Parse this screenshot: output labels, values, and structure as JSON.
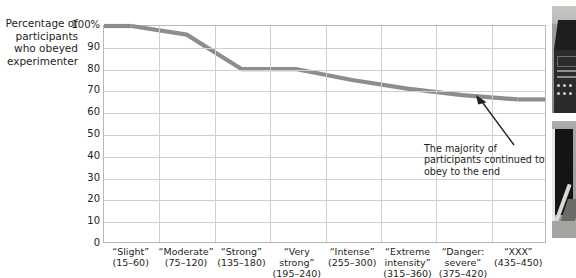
{
  "figure": {
    "y_axis_title": "Percentage of participants who obeyed experimenter",
    "annotation": "The majority of participants continued to obey to the end",
    "line_color": "#8d8d8d",
    "grid_color": "#cfcfcf",
    "text_color": "#231f20",
    "photo_fragments": [
      {
        "name": "shock-generator-photo",
        "alt": "photo-fragment-top"
      },
      {
        "name": "experiment-room-photo",
        "alt": "photo-fragment-bottom"
      }
    ]
  },
  "chart_data": {
    "type": "line",
    "title": "",
    "xlabel": "",
    "ylabel": "Percentage of participants who obeyed experimenter",
    "ylim": [
      0,
      100
    ],
    "yticks": [
      100,
      90,
      80,
      70,
      60,
      50,
      40,
      30,
      20,
      10,
      0
    ],
    "ytick_labels": [
      "100%",
      "90",
      "80",
      "70",
      "60",
      "50",
      "40",
      "30",
      "20",
      "10",
      "0"
    ],
    "grid": true,
    "legend": "none",
    "categories": [
      "“Slight” (15–60)",
      "“Moderate” (75–120)",
      "“Strong” (135–180)",
      "“Very strong” (195–240)",
      "“Intense” (255–300)",
      "“Extreme intensity” (315–360)",
      "“Danger: severe” (375–420)",
      "“XXX” (435–450)"
    ],
    "category_lines": [
      [
        "“Slight”",
        "(15–60)"
      ],
      [
        "“Moderate”",
        "(75–120)"
      ],
      [
        "“Strong”",
        "(135–180)"
      ],
      [
        "“Very",
        "strong”",
        "(195–240)"
      ],
      [
        "“Intense”",
        "(255–300)"
      ],
      [
        "“Extreme",
        "intensity”",
        "(315–360)"
      ],
      [
        "“Danger:",
        "severe”",
        "(375–420)"
      ],
      [
        "“XXX”",
        "(435–450)"
      ]
    ],
    "values": [
      100,
      96,
      80,
      80,
      75,
      71,
      68,
      66
    ],
    "annotations": [
      {
        "text": "The majority of participants continued to obey to the end",
        "points_to_category": "“XXX” (435–450)"
      }
    ]
  }
}
